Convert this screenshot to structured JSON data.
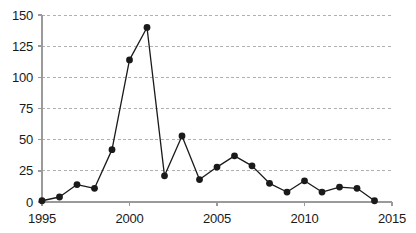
{
  "chart_data": {
    "type": "line",
    "title": "",
    "subtitle": "",
    "xlabel": "",
    "ylabel": "",
    "x": [
      1995,
      1996,
      1997,
      1998,
      1999,
      2000,
      2001,
      2002,
      2003,
      2004,
      2005,
      2006,
      2007,
      2008,
      2009,
      2010,
      2011,
      2012,
      2013,
      2014
    ],
    "values": [
      1,
      4,
      14,
      11,
      42,
      114,
      140,
      21,
      53,
      18,
      28,
      37,
      29,
      15,
      8,
      17,
      8,
      12,
      11,
      1
    ],
    "series": [
      {
        "name": "series-1",
        "values": [
          1,
          4,
          14,
          11,
          42,
          114,
          140,
          21,
          53,
          18,
          28,
          37,
          29,
          15,
          8,
          17,
          8,
          12,
          11,
          1
        ]
      }
    ],
    "xlim": [
      1995,
      2015
    ],
    "ylim": [
      0,
      150
    ],
    "yticks": [
      0,
      25,
      50,
      75,
      100,
      125,
      150
    ],
    "ytick_labels": [
      "0",
      "25",
      "50",
      "75",
      "100",
      "125",
      "150"
    ],
    "xticks": [
      1995,
      2000,
      2005,
      2010,
      2015
    ],
    "xtick_labels": [
      "1995",
      "2000",
      "2005",
      "2010",
      "2015"
    ],
    "grid": {
      "horizontal": true,
      "vertical": false,
      "style": "dashed",
      "color": "#b0b0b0"
    },
    "legend": {
      "visible": false,
      "position": "none",
      "entries": []
    },
    "style": {
      "line_color": "#1a1a1a",
      "marker_color": "#1a1a1a",
      "marker_shape": "circle",
      "axis_color": "#9a9a9a",
      "background": "#ffffff",
      "text_color": "#1a1a1a"
    },
    "annotations": []
  }
}
